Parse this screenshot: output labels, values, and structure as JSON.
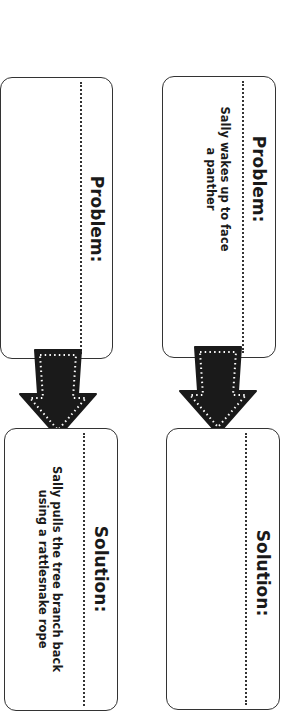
{
  "chains": [
    {
      "problem": {
        "heading": "Problem:",
        "text": ""
      },
      "solution": {
        "heading": "Solution:",
        "text_lines": [
          "Sally pulls the tree branch back",
          "using a rattlesnake rope"
        ]
      }
    },
    {
      "problem": {
        "heading": "Problem:",
        "text_lines": [
          "Sally wakes up to face",
          "a panther"
        ]
      },
      "solution": {
        "heading": "Solution:",
        "text": ""
      }
    }
  ],
  "icons": {
    "arrow": "arrow-down-icon"
  },
  "colors": {
    "border": "#333333",
    "arrow_fill": "#1a1a1a",
    "arrow_dots": "#ffffff"
  }
}
